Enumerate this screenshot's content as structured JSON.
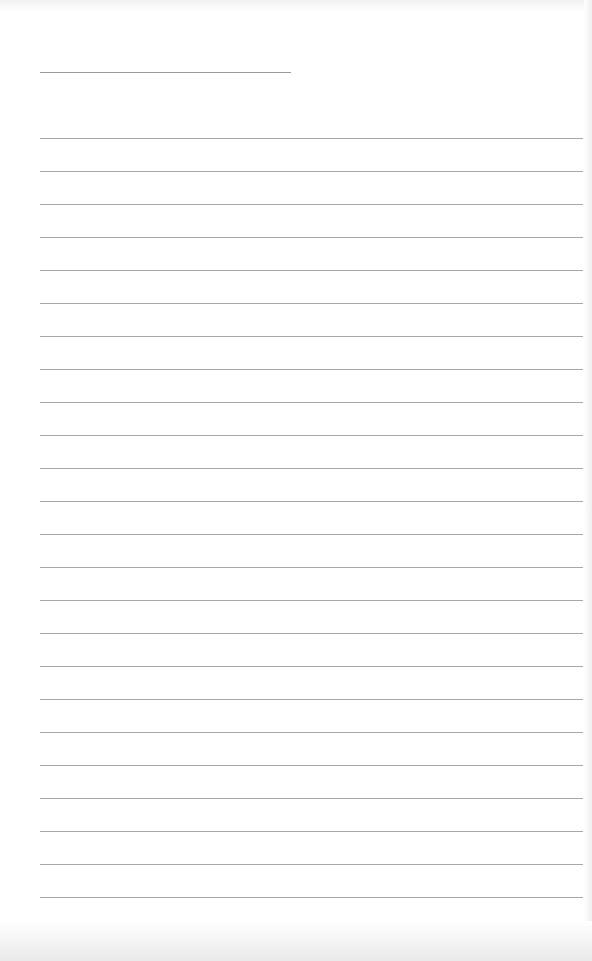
{
  "page": {
    "type": "lined-paper",
    "background": "#ffffff",
    "line_color": "#a8a8a8",
    "title_line": {
      "x": 40,
      "y": 72,
      "width": 251
    },
    "rules": {
      "count": 24,
      "start_y": 138,
      "spacing": 33,
      "x": 40,
      "width": 543
    }
  }
}
